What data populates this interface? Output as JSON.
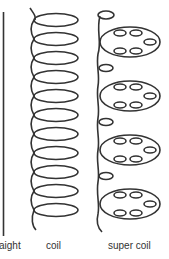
{
  "labels": {
    "straight": "aight",
    "coil": "coil",
    "super_coil": "super coil"
  },
  "colors": {
    "stroke": "#333333",
    "text": "#333333",
    "background": "#ffffff"
  },
  "figure": {
    "panels": [
      {
        "name": "straight",
        "shape": "vertical line"
      },
      {
        "name": "coil",
        "shape": "helix",
        "loops": 11
      },
      {
        "name": "super coil",
        "shape": "coiled helix",
        "large_loops": 4,
        "small_loops_per_large": 6
      }
    ]
  }
}
